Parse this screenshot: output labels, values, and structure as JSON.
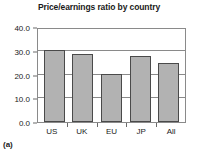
{
  "chart_data": {
    "type": "bar",
    "title": "Price/earnings ratio by country",
    "categories": [
      "US",
      "UK",
      "EU",
      "JP",
      "All"
    ],
    "values": [
      30.5,
      28.8,
      20.3,
      27.7,
      24.8
    ],
    "xlabel": "",
    "ylabel": "",
    "ylim": [
      0.0,
      40.0
    ],
    "ytick_labels": [
      "0.0",
      "10.0",
      "20.0",
      "30.0",
      "40.0"
    ],
    "ytick_values": [
      0.0,
      10.0,
      20.0,
      30.0,
      40.0
    ],
    "grid": true,
    "legend": false,
    "bar_color": "#b2b2b2",
    "bar_edge_color": "#4a4a4a",
    "axis_color": "#8a8a8a"
  },
  "caption": "(a)"
}
